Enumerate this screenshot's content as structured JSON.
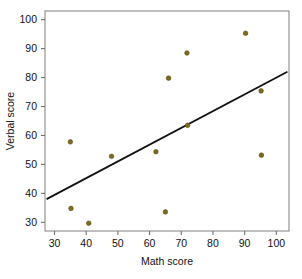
{
  "chart_data": {
    "type": "scatter",
    "title": "",
    "xlabel": "Math score",
    "ylabel": "Verbal score",
    "xlim": [
      27,
      104
    ],
    "ylim": [
      27,
      103
    ],
    "xticks": [
      30,
      40,
      50,
      60,
      70,
      80,
      90,
      100
    ],
    "yticks": [
      30,
      40,
      50,
      60,
      70,
      80,
      90,
      100
    ],
    "xtick_labels": [
      "30",
      "40",
      "50",
      "60",
      "70",
      "80",
      "90",
      "100"
    ],
    "ytick_labels": [
      "30",
      "40",
      "50",
      "60",
      "70",
      "80",
      "90",
      "100"
    ],
    "grid": false,
    "legend": null,
    "marker": {
      "shape": "circle",
      "color": "#7d6a1e",
      "edge_color": "#5c4d12",
      "size_px": 4.6
    },
    "points": [
      {
        "x": 35.0,
        "y": 57.8
      },
      {
        "x": 35.2,
        "y": 34.8
      },
      {
        "x": 40.8,
        "y": 29.7
      },
      {
        "x": 48.0,
        "y": 52.8
      },
      {
        "x": 62.0,
        "y": 54.4
      },
      {
        "x": 65.0,
        "y": 33.6
      },
      {
        "x": 66.0,
        "y": 79.8
      },
      {
        "x": 71.8,
        "y": 88.5
      },
      {
        "x": 72.0,
        "y": 63.5
      },
      {
        "x": 90.3,
        "y": 95.3
      },
      {
        "x": 95.2,
        "y": 75.4
      },
      {
        "x": 95.3,
        "y": 53.2
      }
    ],
    "trend_line": {
      "type": "linear-fit",
      "color": "#111111",
      "x_start": 27.5,
      "y_start": 38.0,
      "x_end": 103.5,
      "y_end": 82.0
    }
  },
  "axes": {
    "x_axis_name": "math-score-axis",
    "y_axis_name": "verbal-score-axis"
  }
}
